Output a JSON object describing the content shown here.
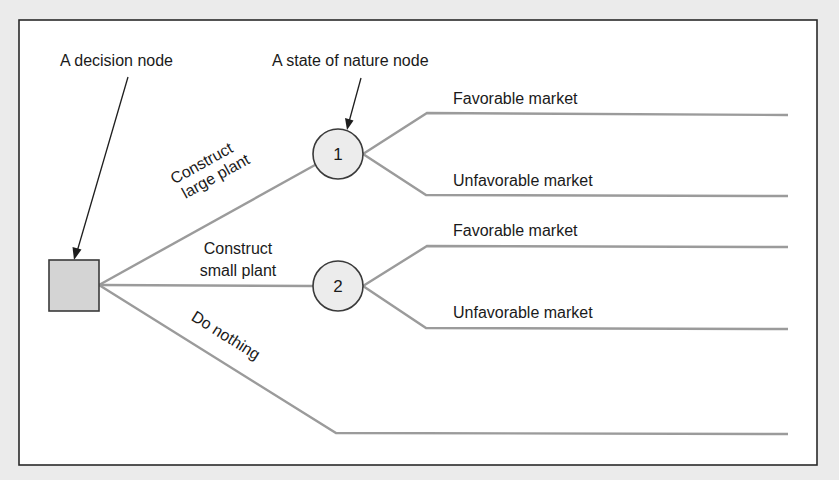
{
  "diagram": {
    "type": "decision-tree",
    "colors": {
      "background": "#ebebeb",
      "frame_fill": "#ffffff",
      "frame_stroke": "#2a2a2a",
      "branch_stroke": "#9b9b9b",
      "decision_node_fill": "#d4d4d4",
      "chance_node_fill": "#ececec"
    },
    "annotations": {
      "decision_node": "A decision node",
      "state_of_nature_node": "A state of nature node"
    },
    "decision_node": {
      "shape": "square",
      "label": ""
    },
    "alternatives": [
      {
        "label_line1": "Construct",
        "label_line2": "large plant",
        "leads_to": "1"
      },
      {
        "label_line1": "Construct",
        "label_line2": "small plant",
        "leads_to": "2"
      },
      {
        "label_line1": "Do nothing",
        "label_line2": "",
        "leads_to": ""
      }
    ],
    "chance_nodes": [
      {
        "id": "1",
        "outcomes": [
          {
            "label": "Favorable market"
          },
          {
            "label": "Unfavorable market"
          }
        ]
      },
      {
        "id": "2",
        "outcomes": [
          {
            "label": "Favorable market"
          },
          {
            "label": "Unfavorable market"
          }
        ]
      }
    ]
  }
}
